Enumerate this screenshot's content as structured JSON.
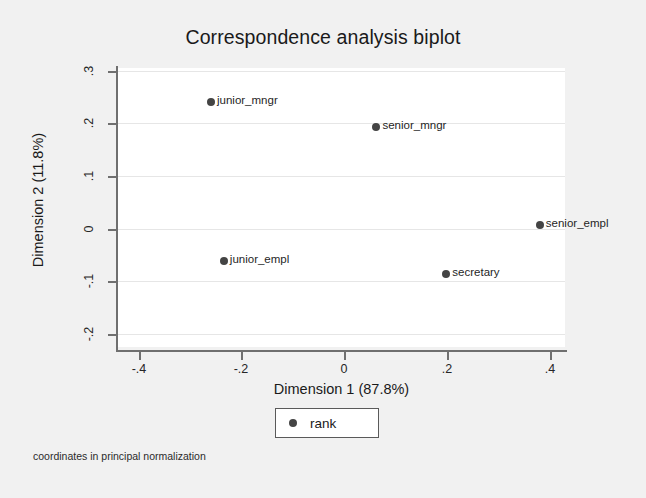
{
  "chart_data": {
    "type": "scatter",
    "title": "Correspondence analysis biplot",
    "xlabel": "Dimension 1 (87.8%)",
    "ylabel": "Dimension 2 (11.8%)",
    "note": "coordinates in principal normalization",
    "xlim": [
      -0.44,
      0.43
    ],
    "ylim": [
      -0.225,
      0.305
    ],
    "xticks": [
      "-.4",
      "-.2",
      "0",
      ".2",
      ".4"
    ],
    "xtickvalues": [
      -0.4,
      -0.2,
      0,
      0.2,
      0.4
    ],
    "yticks": [
      ".3",
      ".2",
      ".1",
      "0",
      "-.1",
      "-.2"
    ],
    "ytickvalues": [
      0.3,
      0.2,
      0.1,
      0,
      -0.1,
      -0.2
    ],
    "grid": "horizontal",
    "legend": {
      "position": "below-axis",
      "entries": [
        {
          "label": "rank",
          "marker": "filled-circle",
          "color": "#444444"
        }
      ]
    },
    "series": [
      {
        "name": "rank",
        "marker": "filled-circle",
        "color": "#444444",
        "points": [
          {
            "label": "junior_mngr",
            "x": -0.259,
            "y": 0.241
          },
          {
            "label": "senior_mngr",
            "x": 0.063,
            "y": 0.192
          },
          {
            "label": "senior_empl",
            "x": 0.381,
            "y": 0.006
          },
          {
            "label": "junior_empl",
            "x": -0.234,
            "y": -0.061
          },
          {
            "label": "secretary",
            "x": 0.199,
            "y": -0.087
          }
        ]
      }
    ],
    "colors": {
      "figure_background": "#f1f1f1",
      "plot_background": "#ffffff",
      "gridline": "#e6e6e6",
      "axis": "#6f6f6f",
      "marker": "#444444",
      "text": "#1a1a1a"
    }
  }
}
